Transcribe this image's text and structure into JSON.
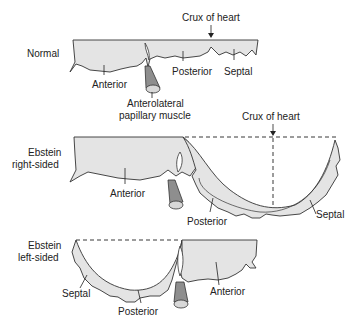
{
  "panels": [
    {
      "id": "normal",
      "title": "Normal",
      "crux_label": "Crux of heart",
      "leaflets": [
        "Anterior",
        "Posterior",
        "Septal"
      ],
      "papillary_label_line1": "Anterolateral",
      "papillary_label_line2": "papillary muscle"
    },
    {
      "id": "ebstein-right",
      "title_line1": "Ebstein",
      "title_line2": "right-sided",
      "crux_label": "Crux of heart",
      "leaflets": [
        "Anterior",
        "Posterior",
        "Septal"
      ]
    },
    {
      "id": "ebstein-left",
      "title_line1": "Ebstein",
      "title_line2": "left-sided",
      "leaflets": [
        "Septal",
        "Posterior",
        "Anterior"
      ]
    }
  ],
  "colors": {
    "leaflet_fill": "#e4e4e4",
    "papillary_fill": "#8e8e8e",
    "outline": "#333333"
  }
}
